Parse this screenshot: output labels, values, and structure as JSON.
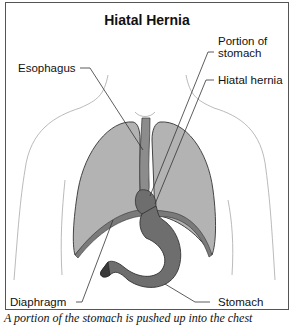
{
  "figure": {
    "title": "Hiatal Hernia",
    "labels": {
      "esophagus": "Esophagus",
      "portion_of_stomach_line1": "Portion of",
      "portion_of_stomach_line2": "stomach",
      "hiatal_hernia": "Hiatal hernia",
      "diaphragm": "Diaphragm",
      "stomach": "Stomach"
    },
    "caption": "A portion of the stomach is pushed up into the chest",
    "colors": {
      "lung_fill": "#b3b3b3",
      "stomach_fill": "#6e6e6e",
      "outline": "#333333",
      "body_outline": "#a8a8a8"
    }
  }
}
